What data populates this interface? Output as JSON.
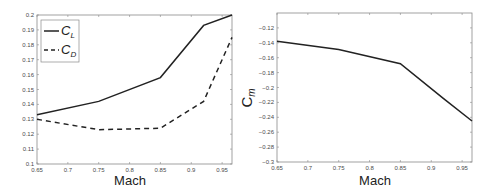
{
  "chart_data": [
    {
      "type": "line",
      "title": "",
      "xlabel": "Mach",
      "ylabel": "",
      "xlim": [
        0.65,
        0.966
      ],
      "ylim": [
        0.1,
        0.2
      ],
      "xticks": [
        "0.65",
        "0.7",
        "0.75",
        "0.8",
        "0.85",
        "0.9",
        "0.95"
      ],
      "yticks": [
        "0.1",
        "0.11",
        "0.12",
        "0.13",
        "0.14",
        "0.15",
        "0.16",
        "0.17",
        "0.18",
        "0.19",
        "0.2"
      ],
      "grid": false,
      "legend_position": "upper left",
      "x": [
        0.65,
        0.75,
        0.85,
        0.92,
        0.966
      ],
      "series": [
        {
          "name": "C_L",
          "label_main": "C",
          "label_sub": "L",
          "style": "solid",
          "values": [
            0.133,
            0.142,
            0.158,
            0.193,
            0.2
          ]
        },
        {
          "name": "C_D",
          "label_main": "C",
          "label_sub": "D",
          "style": "dashed",
          "values": [
            0.13,
            0.123,
            0.124,
            0.142,
            0.185
          ]
        }
      ]
    },
    {
      "type": "line",
      "title": "",
      "xlabel": "Mach",
      "ylabel": "C_m",
      "ylabel_main": "C",
      "ylabel_sub": "m",
      "xlim": [
        0.65,
        0.966
      ],
      "ylim": [
        -0.3,
        -0.1
      ],
      "xticks": [
        "0.65",
        "0.7",
        "0.75",
        "0.8",
        "0.85",
        "0.9",
        "0.95"
      ],
      "yticks": [
        "-0.12",
        "-0.14",
        "-0.16",
        "-0.18",
        "-0.2",
        "-0.22",
        "-0.24",
        "-0.26",
        "-0.28",
        "-0.3"
      ],
      "grid": false,
      "x": [
        0.65,
        0.75,
        0.85,
        0.92,
        0.966
      ],
      "series": [
        {
          "name": "C_m",
          "style": "solid",
          "values": [
            -0.138,
            -0.149,
            -0.168,
            -0.215,
            -0.245
          ]
        }
      ]
    }
  ]
}
